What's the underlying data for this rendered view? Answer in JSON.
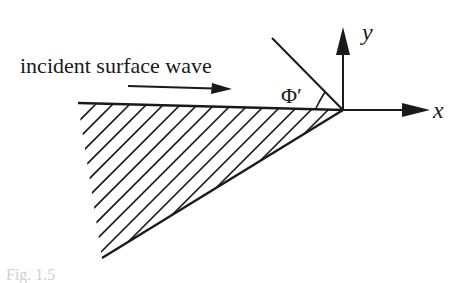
{
  "diagram": {
    "label_incident": "incident surface wave",
    "axis_x_label": "x",
    "axis_y_label": "y",
    "angle_label": "Φ′",
    "caption_fragment": "Fig. 1.5",
    "colors": {
      "ink": "#1a1a1a",
      "background": "#ffffff"
    },
    "geometry": {
      "vertex": [
        343,
        110
      ],
      "surface_start": [
        78,
        103
      ],
      "wedge_bottom": [
        102,
        258
      ],
      "reflected_line_end": [
        272,
        38
      ],
      "y_axis_tip": [
        343,
        26
      ],
      "x_axis_tip": [
        430,
        110
      ],
      "incident_arrow": [
        [
          128,
          86
        ],
        [
          230,
          89
        ]
      ]
    }
  }
}
